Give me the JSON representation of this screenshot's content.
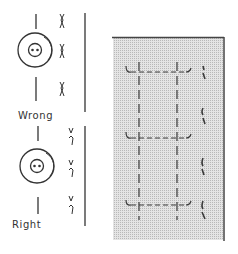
{
  "figure": {
    "type": "sewing-instruction-illustration",
    "labels": {
      "wrong": "Wrong",
      "right": "Right"
    },
    "panels": [
      {
        "name": "wrong-button-placement",
        "label": "Wrong",
        "stitch_marks": 3
      },
      {
        "name": "right-button-placement",
        "label": "Right",
        "stitch_marks": 3
      },
      {
        "name": "fabric-swatch",
        "buttonhole_markings": 3
      }
    ],
    "colors": {
      "ink": "#333333",
      "swatch_shade": "#d9d9d9",
      "swatch_border": "#444444",
      "background": "#ffffff"
    }
  }
}
